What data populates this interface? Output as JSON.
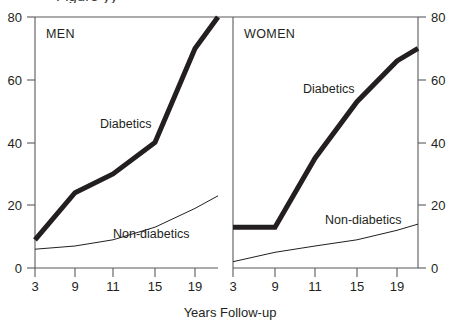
{
  "figure": {
    "cropped_title": "Figure  yy",
    "x_axis_title": "Years Follow-up"
  },
  "chart_data": {
    "type": "line",
    "title": "",
    "xlabel": "Years Follow-up",
    "ylabel": "",
    "ylim": [
      0,
      80
    ],
    "yticks": [
      0,
      20,
      40,
      60,
      80
    ],
    "xticks": [
      "3",
      "9",
      "11",
      "15",
      "19"
    ],
    "grid": false,
    "legend": "inline-annotations",
    "panels": [
      {
        "name": "MEN",
        "label": "MEN",
        "x": [
          3,
          9,
          11,
          15,
          19,
          22
        ],
        "series": [
          {
            "name": "Diabetics",
            "label": "Diabetics",
            "style": "thick",
            "values": [
              9,
              24,
              30,
              40,
              70,
              80
            ]
          },
          {
            "name": "Non-diabetics",
            "label": "Non-diabetics",
            "style": "thin",
            "values": [
              6,
              7,
              9,
              13,
              19,
              23
            ]
          }
        ]
      },
      {
        "name": "WOMEN",
        "label": "WOMEN",
        "x": [
          3,
          9,
          11,
          15,
          19,
          22
        ],
        "series": [
          {
            "name": "Diabetics",
            "label": "Diabetics",
            "style": "thick",
            "values": [
              13,
              13,
              35,
              53,
              66,
              70
            ]
          },
          {
            "name": "Non-diabetics",
            "label": "Non-diabetics",
            "style": "thin",
            "values": [
              2,
              5,
              7,
              9,
              12,
              14
            ]
          }
        ]
      }
    ]
  },
  "axes": {
    "left": {
      "ticks": [
        "80",
        "60",
        "40",
        "20",
        "0"
      ]
    },
    "right": {
      "ticks": [
        "80",
        "60",
        "40",
        "20",
        "0"
      ]
    },
    "men_x_ticks": [
      "3",
      "9",
      "11",
      "15",
      "19"
    ],
    "women_x_ticks": [
      "3",
      "9",
      "11",
      "15",
      "19"
    ]
  }
}
